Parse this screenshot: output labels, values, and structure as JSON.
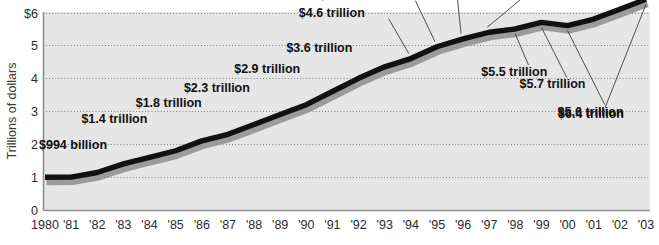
{
  "chart_data": {
    "type": "line",
    "title": "",
    "subtitle": "",
    "xlabel": "",
    "ylabel": "Trillions of dollars",
    "ylim": [
      0,
      6
    ],
    "xlim": [
      1980,
      2003
    ],
    "grid": true,
    "legend": "none",
    "y_ticks": [
      "$6",
      "5",
      "4",
      "3",
      "2",
      "1",
      "0"
    ],
    "y_tick_values": [
      6,
      5,
      4,
      3,
      2,
      1,
      0
    ],
    "x": [
      1980,
      1981,
      1982,
      1983,
      1984,
      1985,
      1986,
      1987,
      1988,
      1989,
      1990,
      1991,
      1992,
      1993,
      1994,
      1995,
      1996,
      1997,
      1998,
      1999,
      2000,
      2001,
      2002,
      2003
    ],
    "categories": [
      "1980",
      "'81",
      "'82",
      "'83",
      "'84",
      "'85",
      "'86",
      "'87",
      "'88",
      "'89",
      "'90",
      "'91",
      "'92",
      "'93",
      "'94",
      "'95",
      "'96",
      "'97",
      "'98",
      "'99",
      "'00",
      "'01",
      "'02",
      "'03"
    ],
    "values": [
      0.994,
      1.0,
      1.14,
      1.4,
      1.6,
      1.8,
      2.1,
      2.3,
      2.6,
      2.9,
      3.2,
      3.6,
      4.0,
      4.35,
      4.6,
      4.96,
      5.2,
      5.4,
      5.5,
      5.7,
      5.6,
      5.8,
      6.1,
      6.4
    ],
    "series": [
      {
        "name": "Total debt",
        "values": [
          0.994,
          1.0,
          1.14,
          1.4,
          1.6,
          1.8,
          2.1,
          2.3,
          2.6,
          2.9,
          3.2,
          3.6,
          4.0,
          4.35,
          4.6,
          4.96,
          5.2,
          5.4,
          5.5,
          5.7,
          5.6,
          5.8,
          6.1,
          6.4
        ]
      }
    ],
    "annotations": [
      {
        "label": "$994 billion",
        "year": 1980,
        "value": 0.994
      },
      {
        "label": "$1.4 trillion",
        "year": 1983,
        "value": 1.4
      },
      {
        "label": "$1.8 trillion",
        "year": 1985,
        "value": 1.8
      },
      {
        "label": "$2.3 trillion",
        "year": 1987,
        "value": 2.3
      },
      {
        "label": "$2.9 trillion",
        "year": 1989,
        "value": 2.9
      },
      {
        "label": "$3.6 trillion",
        "year": 1991,
        "value": 3.6
      },
      {
        "label": "$4.6 trillion",
        "year": 1994,
        "value": 4.6
      },
      {
        "label": "$4.96 trillion",
        "year": 1995,
        "value": 4.96
      },
      {
        "label": "$5.2 trillion",
        "year": 1996,
        "value": 5.2
      },
      {
        "label": "$5.4 trillion",
        "year": 1997,
        "value": 5.4
      },
      {
        "label": "$5.5 trillion",
        "year": 1998,
        "value": 5.5
      },
      {
        "label": "$5.7 trillion",
        "year": 1999,
        "value": 5.7
      },
      {
        "label": "$5.6 trillion",
        "year": 2000,
        "value": 5.6
      },
      {
        "label": "$6.4 trillion",
        "year": 2003,
        "value": 6.4
      }
    ],
    "colors": {
      "plot_background": "#e6e6e6",
      "page_background": "#ffffff",
      "line": "#111111",
      "line_shadow": "#9b9b9b",
      "gridline": "#6f6f6f",
      "axis": "#8e8e8e",
      "text": "#2b2b2b"
    }
  }
}
